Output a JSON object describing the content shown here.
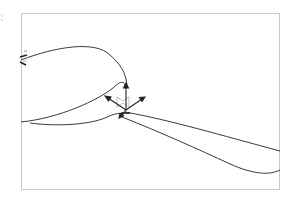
{
  "viewport": {
    "name": "3D viewport",
    "frame_color": "#c8c8c8",
    "curve_color": "#3a3a3a",
    "gizmo_color": "#222222",
    "gizmo_ghost_color": "#b0b0b0",
    "side_mark_color": "#9a9a9a"
  }
}
